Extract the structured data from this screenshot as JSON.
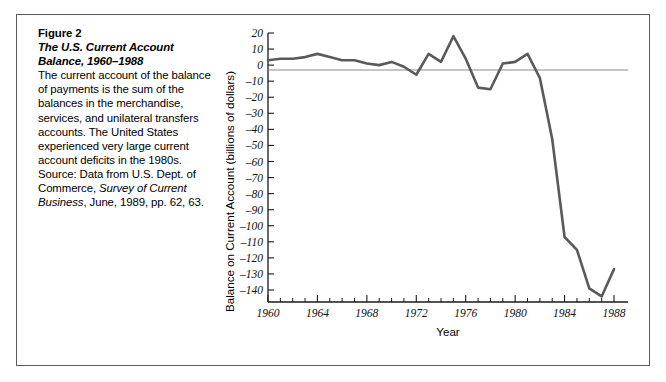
{
  "figure": {
    "number": "Figure 2",
    "title": "The U.S. Current Account Balance, 1960–1988",
    "body": "The current account of the balance of payments is the sum of the balances in the merchandise, services, and unilateral transfers accounts. The United States experienced very large current account deficits in the 1980s.",
    "source_prefix": "Source: Data from U.S. Dept. of Commerce, ",
    "source_italic": "Survey of Current Business",
    "source_suffix": ", June, 1989, pp. 62, 63."
  },
  "colors": {
    "line": "#5a5a5a",
    "axis": "#1a1a1a",
    "zero_rule": "#8a8a8a",
    "frame": "#5b5b5b",
    "background": "#ffffff"
  },
  "chart_data": {
    "type": "line",
    "xlabel": "Year",
    "ylabel": "Balance on Current Account (billions of dollars)",
    "xlim": [
      1960,
      1988
    ],
    "ylim": [
      -145,
      20
    ],
    "ytick_step": 10,
    "xtick_step": 4,
    "grid": false,
    "legend": "none",
    "yticks": [
      20,
      10,
      0,
      -10,
      -20,
      -30,
      -40,
      -50,
      -60,
      -70,
      -80,
      -90,
      -100,
      -110,
      -120,
      -130,
      -140
    ],
    "ytick_labels": [
      "20",
      "10",
      "0",
      "–10",
      "–20",
      "–30",
      "–40",
      "–50",
      "–60",
      "–70",
      "–80",
      "–90",
      "–100",
      "–110",
      "–120",
      "–130",
      "–140"
    ],
    "xticks": [
      1960,
      1964,
      1968,
      1972,
      1976,
      1980,
      1984,
      1988
    ],
    "xtick_labels": [
      "1960",
      "1964",
      "1968",
      "1972",
      "1976",
      "1980",
      "1984",
      "1988"
    ],
    "x": [
      1960,
      1961,
      1962,
      1963,
      1964,
      1965,
      1966,
      1967,
      1968,
      1969,
      1970,
      1971,
      1972,
      1973,
      1974,
      1975,
      1976,
      1977,
      1978,
      1979,
      1980,
      1981,
      1982,
      1983,
      1984,
      1985,
      1986,
      1987,
      1988
    ],
    "values": [
      3,
      4,
      4,
      5,
      7,
      5,
      3,
      3,
      1,
      0,
      2,
      -1,
      -6,
      7,
      2,
      18,
      4,
      -14,
      -15,
      1,
      2,
      7,
      -8,
      -46,
      -107,
      -115,
      -139,
      -144,
      -127
    ],
    "series": [
      {
        "name": "Balance on Current Account",
        "values": [
          3,
          4,
          4,
          5,
          7,
          5,
          3,
          3,
          1,
          0,
          2,
          -1,
          -6,
          7,
          2,
          18,
          4,
          -14,
          -15,
          1,
          2,
          7,
          -8,
          -46,
          -107,
          -115,
          -139,
          -144,
          -127
        ]
      }
    ]
  }
}
